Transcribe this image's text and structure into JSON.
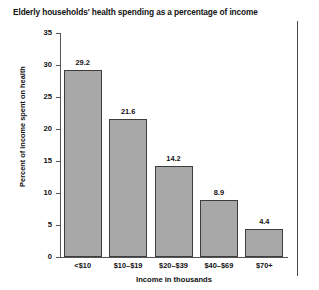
{
  "chart_data": {
    "type": "bar",
    "title": "Elderly households' health spending as a percentage of income",
    "xlabel": "Income in thousands",
    "ylabel": "Percent of income spent on health",
    "categories": [
      "<$10",
      "$10–$19",
      "$20–$39",
      "$40–$69",
      "$70+"
    ],
    "values": [
      29.2,
      21.6,
      14.2,
      8.9,
      4.4
    ],
    "value_labels": [
      "29.2",
      "21.6",
      "14.2",
      "8.9",
      "4.4"
    ],
    "ylim": [
      0,
      35
    ],
    "yticks": [
      0,
      5,
      10,
      15,
      20,
      25,
      30,
      35
    ],
    "ytick_labels": [
      "0",
      "5",
      "10",
      "15",
      "20",
      "25",
      "30",
      "35"
    ],
    "grid": false,
    "legend": false,
    "colors": {
      "bar_fill": "#a8a8a8",
      "bar_edge": "#3d3d3d",
      "axis": "#555555",
      "text": "#111111",
      "background": "#ffffff"
    }
  }
}
